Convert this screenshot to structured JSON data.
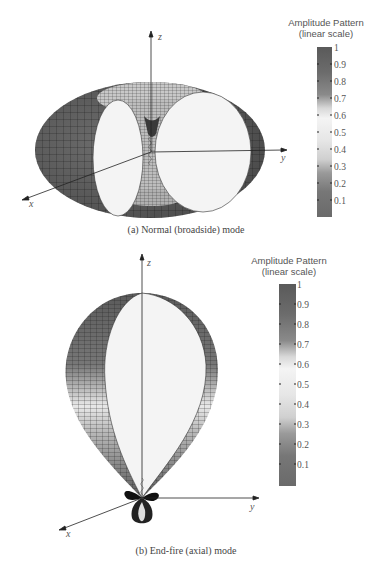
{
  "figures": [
    {
      "id": "a",
      "caption": "(a) Normal (broadside) mode",
      "axes": {
        "x": "x",
        "y": "y",
        "z": "z"
      },
      "colorbar": {
        "title_line1": "Amplitude Pattern",
        "title_line2": "(linear scale)",
        "ticks": [
          "1",
          "0.9",
          "0.8",
          "0.7",
          "0.6",
          "0.5",
          "0.4",
          "0.3",
          "0.2",
          "0.1"
        ]
      },
      "shape": "toroidal doughnut pattern (cut-away), max perpendicular to helix axis"
    },
    {
      "id": "b",
      "caption": "(b) End-fire (axial) mode",
      "axes": {
        "x": "x",
        "y": "y",
        "z": "z"
      },
      "colorbar": {
        "title_line1": "Amplitude Pattern",
        "title_line2": "(linear scale)",
        "ticks": [
          "1",
          "0.9",
          "0.8",
          "0.7",
          "0.6",
          "0.5",
          "0.4",
          "0.3",
          "0.2",
          "0.1"
        ]
      },
      "shape": "single main lobe along +z with small side/back lobes (cut-away)"
    }
  ],
  "colors": {
    "surface_dark": "#5a5a5a",
    "surface_mid": "#8a8a8a",
    "cut_face": "#f4f4f4",
    "axis": "#222222",
    "mesh": "#1a1a1a"
  }
}
